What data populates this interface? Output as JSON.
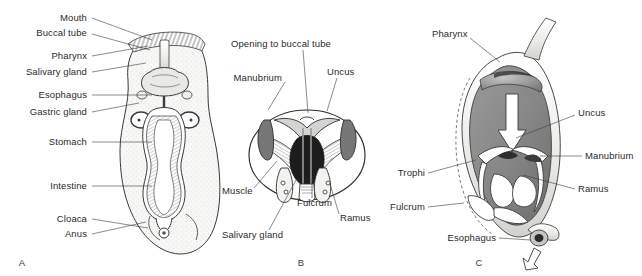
{
  "figure": {
    "background": "#ffffff",
    "text_color": "#2b2b2b",
    "line_color": "#3c3c3c"
  },
  "panels": [
    {
      "letter": "A",
      "caption": "Whole-body digestive tract, dorsal view",
      "letter_pos": {
        "x": 22,
        "y": 262
      },
      "labels": [
        {
          "text": "Mouth",
          "x": 87,
          "y": 18,
          "align": "right",
          "leader": [
            [
              92,
              18
            ],
            [
              152,
              40
            ]
          ]
        },
        {
          "text": "Buccal tube",
          "x": 87,
          "y": 33,
          "align": "right",
          "leader": [
            [
              92,
              34
            ],
            [
              150,
              50
            ]
          ]
        },
        {
          "text": "Pharynx",
          "x": 87,
          "y": 56,
          "align": "right",
          "leader": [
            [
              92,
              56
            ],
            [
              148,
              46
            ]
          ]
        },
        {
          "text": "Salivary gland",
          "x": 87,
          "y": 72,
          "align": "right",
          "leader": [
            [
              92,
              72
            ],
            [
              146,
              63
            ]
          ]
        },
        {
          "text": "Esophagus",
          "x": 87,
          "y": 95,
          "align": "right",
          "leader": [
            [
              92,
              95
            ],
            [
              152,
              95
            ]
          ]
        },
        {
          "text": "Gastric gland",
          "x": 87,
          "y": 112,
          "align": "right",
          "leader": [
            [
              92,
              112
            ],
            [
              139,
              103
            ]
          ]
        },
        {
          "text": "Stomach",
          "x": 87,
          "y": 142,
          "align": "right",
          "leader": [
            [
              92,
              142
            ],
            [
              152,
              142
            ]
          ]
        },
        {
          "text": "Intestine",
          "x": 87,
          "y": 186,
          "align": "right",
          "leader": [
            [
              92,
              186
            ],
            [
              152,
              186
            ]
          ]
        },
        {
          "text": "Cloaca",
          "x": 87,
          "y": 219,
          "align": "right",
          "leader": [
            [
              92,
              219
            ],
            [
              148,
              228
            ]
          ]
        },
        {
          "text": "Anus",
          "x": 87,
          "y": 234,
          "align": "right",
          "leader": [
            [
              92,
              234
            ],
            [
              146,
              222
            ]
          ]
        }
      ]
    },
    {
      "letter": "B",
      "caption": "Mastax with trophi, frontal view",
      "letter_pos": {
        "x": 301,
        "y": 262
      },
      "labels": [
        {
          "text": "Opening to buccal tube",
          "x": 231,
          "y": 44,
          "align": "left",
          "leader": [
            [
              303,
              50
            ],
            [
              308,
              113
            ]
          ]
        },
        {
          "text": "Manubrium",
          "x": 282,
          "y": 78,
          "align": "right",
          "leader": [
            [
              285,
              82
            ],
            [
              268,
              110
            ]
          ]
        },
        {
          "text": "Uncus",
          "x": 327,
          "y": 72,
          "align": "left",
          "leader": [
            [
              337,
              78
            ],
            [
              327,
              111
            ]
          ]
        },
        {
          "text": "Muscle",
          "x": 222,
          "y": 191,
          "align": "left",
          "leader": [
            [
              254,
              188
            ],
            [
              277,
              161
            ]
          ]
        },
        {
          "text": "Fulcrum",
          "x": 297,
          "y": 203,
          "align": "left",
          "leader": [
            [
              312,
              198
            ],
            [
              312,
              178
            ]
          ]
        },
        {
          "text": "Ramus",
          "x": 340,
          "y": 218,
          "align": "left",
          "leader": [
            [
              339,
              214
            ],
            [
              330,
              184
            ]
          ]
        },
        {
          "text": "Salivary gland",
          "x": 222,
          "y": 235,
          "align": "left",
          "leader": [
            [
              269,
              230
            ],
            [
              296,
              180
            ]
          ]
        }
      ]
    },
    {
      "letter": "C",
      "caption": "Mastax cutaway showing trophi and food flow",
      "letter_pos": {
        "x": 479,
        "y": 262
      },
      "labels": [
        {
          "text": "Pharynx",
          "x": 432,
          "y": 34,
          "align": "left",
          "leader": [
            [
              470,
              38
            ],
            [
              500,
              62
            ]
          ]
        },
        {
          "text": "Uncus",
          "x": 578,
          "y": 113,
          "align": "left",
          "leader": [
            [
              575,
              115
            ],
            [
              516,
              138
            ]
          ]
        },
        {
          "text": "Manubrium",
          "x": 585,
          "y": 156,
          "align": "left",
          "leader": [
            [
              582,
              156
            ],
            [
              540,
              156
            ]
          ]
        },
        {
          "text": "Ramus",
          "x": 578,
          "y": 189,
          "align": "left",
          "leader": [
            [
              575,
              189
            ],
            [
              523,
              175
            ]
          ]
        },
        {
          "text": "Trophi",
          "x": 425,
          "y": 173,
          "align": "right",
          "leader": [
            [
              428,
              173
            ],
            [
              476,
              160
            ]
          ]
        },
        {
          "text": "Fulcrum",
          "x": 425,
          "y": 207,
          "align": "right",
          "leader": [
            [
              428,
              207
            ],
            [
              464,
              203
            ]
          ]
        },
        {
          "text": "Esophagus",
          "x": 496,
          "y": 238,
          "align": "right",
          "leader": [
            [
              499,
              238
            ],
            [
              531,
              240
            ]
          ]
        }
      ]
    }
  ]
}
